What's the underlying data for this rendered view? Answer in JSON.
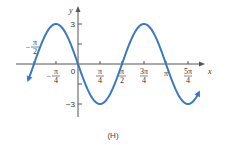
{
  "chart_data": {
    "type": "line",
    "title": "",
    "caption": "(H)",
    "xlabel": "x",
    "ylabel": "y",
    "function": "y = -3 sin(2x)",
    "xlim": [
      -1.78,
      4.32
    ],
    "ylim": [
      -3.5,
      3.5
    ],
    "x_ticks": [
      {
        "value": -0.7854,
        "label_num": "π",
        "label_den": "4",
        "sign": "−"
      },
      {
        "value": 0.7854,
        "label_num": "π",
        "label_den": "4",
        "sign": ""
      },
      {
        "value": 1.5708,
        "label_num": "π",
        "label_den": "2",
        "sign": ""
      },
      {
        "value": 2.3562,
        "label_num": "3π",
        "label_den": "4",
        "sign": ""
      },
      {
        "value": 3.1416,
        "label": "π"
      },
      {
        "value": 3.927,
        "label_num": "5π",
        "label_den": "4",
        "sign": ""
      }
    ],
    "neg_pi_over_2_label": {
      "sign": "−",
      "num": "π",
      "den": "2"
    },
    "origin_label": "0",
    "y_ticks": [
      {
        "value": 3,
        "label": "3"
      },
      {
        "value": 1.5,
        "label": ""
      },
      {
        "value": -1.5,
        "label": ""
      },
      {
        "value": -3,
        "label": "−3"
      }
    ],
    "key_points": [
      {
        "x": -1.5708,
        "y": 0
      },
      {
        "x": -0.7854,
        "y": 3
      },
      {
        "x": 0,
        "y": 0
      },
      {
        "x": 0.7854,
        "y": -3
      },
      {
        "x": 1.5708,
        "y": 0
      },
      {
        "x": 2.3562,
        "y": 3
      },
      {
        "x": 3.1416,
        "y": 0
      },
      {
        "x": 3.927,
        "y": -3
      }
    ],
    "domain": [
      -1.78,
      4.32
    ],
    "curve_color": "#3a78c2",
    "axis_color": "#555555"
  }
}
